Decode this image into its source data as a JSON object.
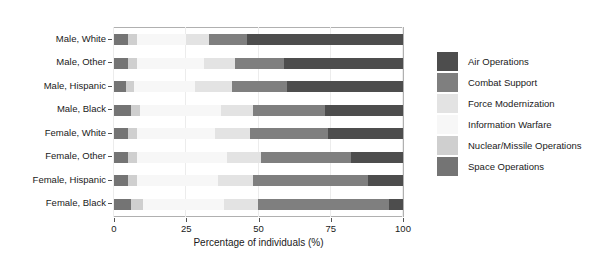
{
  "chart_data": {
    "type": "bar",
    "orientation": "horizontal",
    "stacked": true,
    "normalized": true,
    "title": "",
    "xlabel": "Percentage of individuals (%)",
    "ylabel": "",
    "xlim": [
      0,
      100
    ],
    "xticks": [
      0,
      25,
      50,
      75,
      100
    ],
    "xticklabels": [
      "0",
      "25",
      "50",
      "75",
      "100"
    ],
    "grid": "vertical",
    "legend_position": "right",
    "categories": [
      "Male, White",
      "Male, Other",
      "Male, Hispanic",
      "Male, Black",
      "Female, White",
      "Female, Other",
      "Female, Hispanic",
      "Female, Black"
    ],
    "series": [
      {
        "name": "Air Operations",
        "color": "#4d4d4d",
        "values": [
          54,
          41,
          40,
          27,
          26,
          18,
          12,
          5
        ]
      },
      {
        "name": "Combat Support",
        "color": "#7f7f7f",
        "values": [
          13,
          17,
          19,
          25,
          27,
          31,
          40,
          45
        ]
      },
      {
        "name": "Force Modernization",
        "color": "#e3e3e3",
        "values": [
          8,
          11,
          13,
          11,
          12,
          12,
          12,
          12
        ]
      },
      {
        "name": "Information Warfare",
        "color": "#f7f7f7",
        "values": [
          17,
          23,
          21,
          28,
          27,
          31,
          28,
          28
        ]
      },
      {
        "name": "Nuclear/Missile Operations",
        "color": "#cfcfcf",
        "values": [
          3,
          3,
          3,
          3,
          3,
          3,
          3,
          4
        ]
      },
      {
        "name": "Space Operations",
        "color": "#747474",
        "values": [
          5,
          5,
          4,
          6,
          5,
          5,
          5,
          6
        ]
      }
    ],
    "stack_order": [
      "Space Operations",
      "Nuclear/Missile Operations",
      "Information Warfare",
      "Force Modernization",
      "Combat Support",
      "Air Operations"
    ],
    "legend_entries": [
      {
        "label": "Air Operations",
        "color": "#4d4d4d"
      },
      {
        "label": "Combat Support",
        "color": "#7f7f7f"
      },
      {
        "label": "Force Modernization",
        "color": "#e3e3e3"
      },
      {
        "label": "Information Warfare",
        "color": "#f7f7f7"
      },
      {
        "label": "Nuclear/Missile Operations",
        "color": "#cfcfcf"
      },
      {
        "label": "Space Operations",
        "color": "#747474"
      }
    ]
  }
}
